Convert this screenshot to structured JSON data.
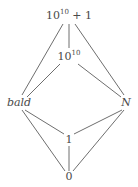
{
  "diagram": {
    "type": "hasse-lattice",
    "nodes": [
      {
        "id": "top",
        "base": "10",
        "exp": "10",
        "suffix": " + 1",
        "x": 69,
        "y": 16
      },
      {
        "id": "ten10",
        "base": "10",
        "exp": "10",
        "suffix": "",
        "x": 69,
        "y": 57
      },
      {
        "id": "bald",
        "label": "bald",
        "italic": true,
        "x": 19,
        "y": 103
      },
      {
        "id": "N",
        "label": "N",
        "italic": true,
        "x": 126,
        "y": 103
      },
      {
        "id": "one",
        "label": "1",
        "x": 69,
        "y": 140
      },
      {
        "id": "zero",
        "label": "0",
        "x": 69,
        "y": 177
      }
    ],
    "edges": [
      [
        "top",
        "ten10"
      ],
      [
        "top",
        "bald"
      ],
      [
        "top",
        "N"
      ],
      [
        "ten10",
        "bald"
      ],
      [
        "ten10",
        "N"
      ],
      [
        "bald",
        "one"
      ],
      [
        "bald",
        "zero"
      ],
      [
        "N",
        "one"
      ],
      [
        "N",
        "zero"
      ],
      [
        "one",
        "zero"
      ]
    ],
    "line_color": "#6e6e6e"
  }
}
